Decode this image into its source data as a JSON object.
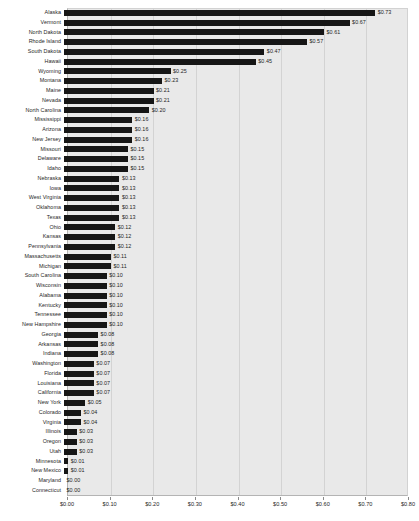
{
  "chart_data": {
    "type": "bar",
    "orientation": "horizontal",
    "title": "",
    "subtitle": "",
    "xlabel": "",
    "ylabel": "",
    "xlim": [
      0,
      0.8
    ],
    "grid": true,
    "legend": null,
    "bar_color": "#161616",
    "plot_background": "#e9e9e9",
    "value_prefix": "$",
    "value_decimals": 2,
    "xtick_labels": [
      "$0.00",
      "$0.10",
      "$0.20",
      "$0.30",
      "$0.40",
      "$0.50",
      "$0.60",
      "$0.70",
      "$0.80"
    ],
    "xtick_values": [
      0,
      0.1,
      0.2,
      0.3,
      0.4,
      0.5,
      0.6,
      0.7,
      0.8
    ],
    "categories": [
      "Alaska",
      "Vermont",
      "North Dakota",
      "Rhode Island",
      "South Dakota",
      "Hawaii",
      "Wyoming",
      "Montana",
      "Maine",
      "Nevada",
      "North Carolina",
      "Mississippi",
      "Arizona",
      "New Jersey",
      "Missouri",
      "Delaware",
      "Idaho",
      "Nebraska",
      "Iowa",
      "West Virginia",
      "Oklahoma",
      "Texas",
      "Ohio",
      "Kansas",
      "Pennsylvania",
      "Massachusetts",
      "Michigan",
      "South Carolina",
      "Wisconsin",
      "Alabama",
      "Kentucky",
      "Tennessee",
      "New Hampshire",
      "Georgia",
      "Arkansas",
      "Indiana",
      "Washington",
      "Florida",
      "Louisiana",
      "California",
      "New York",
      "Colorado",
      "Virginia",
      "Illinois",
      "Oregon",
      "Utah",
      "Minnesota",
      "New Mexico",
      "Maryland",
      "Connecticut"
    ],
    "values": [
      0.73,
      0.67,
      0.61,
      0.57,
      0.47,
      0.45,
      0.25,
      0.23,
      0.21,
      0.21,
      0.2,
      0.16,
      0.16,
      0.16,
      0.15,
      0.15,
      0.15,
      0.13,
      0.13,
      0.13,
      0.13,
      0.13,
      0.12,
      0.12,
      0.12,
      0.11,
      0.11,
      0.1,
      0.1,
      0.1,
      0.1,
      0.1,
      0.1,
      0.08,
      0.08,
      0.08,
      0.07,
      0.07,
      0.07,
      0.07,
      0.05,
      0.04,
      0.04,
      0.03,
      0.03,
      0.03,
      0.01,
      0.01,
      0.0,
      0.0
    ],
    "value_labels": [
      "$0.73",
      "$0.67",
      "$0.61",
      "$0.57",
      "$0.47",
      "$0.45",
      "$0.25",
      "$0.23",
      "$0.21",
      "$0.21",
      "$0.20",
      "$0.16",
      "$0.16",
      "$0.16",
      "$0.15",
      "$0.15",
      "$0.15",
      "$0.13",
      "$0.13",
      "$0.13",
      "$0.13",
      "$0.13",
      "$0.12",
      "$0.12",
      "$0.12",
      "$0.11",
      "$0.11",
      "$0.10",
      "$0.10",
      "$0.10",
      "$0.10",
      "$0.10",
      "$0.10",
      "$0.08",
      "$0.08",
      "$0.08",
      "$0.07",
      "$0.07",
      "$0.07",
      "$0.07",
      "$0.05",
      "$0.04",
      "$0.04",
      "$0.03",
      "$0.03",
      "$0.03",
      "$0.01",
      "$0.01",
      "$0.00",
      "$0.00"
    ]
  }
}
